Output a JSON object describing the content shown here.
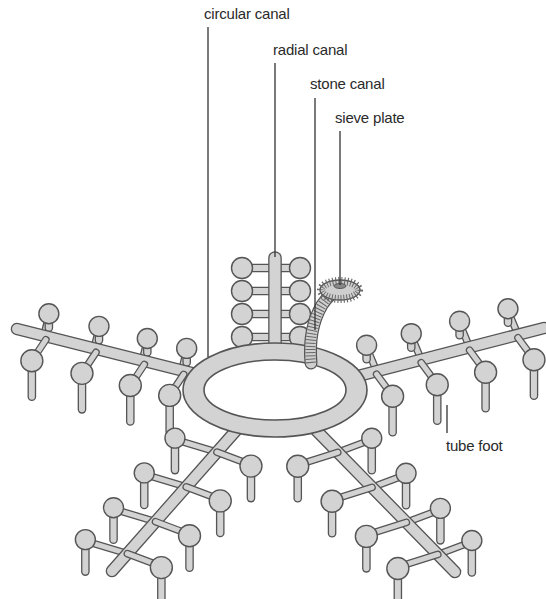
{
  "diagram": {
    "labels": {
      "circular_canal": "circular canal",
      "radial_canal": "radial canal",
      "stone_canal": "stone canal",
      "sieve_plate": "sieve plate",
      "tube_foot": "tube foot"
    },
    "colors": {
      "canal_fill": "#d3d3d3",
      "outline": "#555555",
      "text": "#2a2a2a"
    },
    "arms": [
      "top",
      "left",
      "right",
      "bottom-left",
      "bottom-right"
    ]
  }
}
